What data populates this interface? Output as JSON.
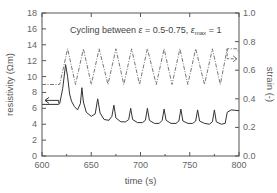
{
  "chart_data": {
    "type": "line",
    "title": "",
    "annotation": {
      "prefix": "Cycling between ",
      "epsilon": "ε",
      "range": " = 0.5-0.75, ",
      "epsilon_max": "ε",
      "max_sub": "max",
      "max_value": " = 1"
    },
    "xlabel": "time (s)",
    "ylabel_left": "resistivity (Ωm)",
    "ylabel_right": "strain (-)",
    "xlim": [
      600,
      800
    ],
    "ylim_left": [
      0,
      18
    ],
    "ylim_right": [
      0.0,
      1.0
    ],
    "x_ticks": [
      "600",
      "650",
      "700",
      "750",
      "800"
    ],
    "y_ticks_left": [
      "0",
      "2",
      "4",
      "6",
      "8",
      "10",
      "12",
      "14",
      "16",
      "18"
    ],
    "y_ticks_right": [
      "0.0",
      "0.2",
      "0.4",
      "0.6",
      "0.8",
      "1.0"
    ],
    "grid": false,
    "legend": "none (arrows indicate axis for each series)",
    "series": [
      {
        "name": "resistivity",
        "axis": "left",
        "style": "solid",
        "color": "#333333",
        "x": [
          600,
          617,
          618,
          621,
          624,
          626,
          628,
          630,
          633,
          636,
          639,
          640.5,
          642,
          645,
          650,
          654,
          656.5,
          659,
          663,
          668,
          671,
          673,
          675,
          680,
          685,
          688,
          690,
          692,
          697,
          702,
          705,
          707,
          709,
          714,
          719,
          722,
          724,
          726,
          731,
          736,
          739,
          741,
          743,
          748,
          753,
          756,
          758,
          760,
          765,
          770,
          773,
          775,
          777,
          782,
          786,
          788,
          792,
          800
        ],
        "y": [
          6.5,
          6.5,
          6.6,
          8.5,
          11.5,
          10.0,
          7.8,
          6.9,
          6.2,
          5.8,
          6.6,
          8.6,
          6.8,
          5.5,
          5.0,
          5.3,
          7.2,
          5.4,
          4.6,
          4.5,
          5.0,
          6.4,
          4.8,
          4.3,
          4.3,
          4.6,
          6.0,
          4.6,
          4.2,
          4.2,
          4.5,
          6.0,
          4.5,
          4.1,
          4.1,
          4.5,
          5.9,
          4.5,
          4.1,
          4.1,
          4.4,
          5.9,
          4.4,
          4.1,
          4.1,
          4.4,
          5.8,
          4.4,
          4.1,
          4.0,
          4.3,
          5.8,
          4.3,
          4.0,
          4.1,
          5.5,
          5.8,
          5.7
        ]
      },
      {
        "name": "strain",
        "axis": "right",
        "style": "dash-dot",
        "color": "#777777",
        "x": [
          600,
          618,
          626,
          634,
          642,
          650,
          658,
          667,
          675,
          683,
          691,
          699,
          707,
          716,
          724,
          732,
          740,
          748,
          756,
          765,
          773,
          781,
          788,
          798,
          800
        ],
        "y": [
          0.5,
          0.5,
          0.75,
          0.5,
          0.75,
          0.5,
          0.75,
          0.5,
          0.75,
          0.5,
          0.75,
          0.5,
          0.75,
          0.5,
          0.75,
          0.5,
          0.75,
          0.5,
          0.75,
          0.5,
          0.75,
          0.5,
          0.75,
          0.75,
          0.72
        ]
      }
    ],
    "arrows": [
      {
        "series": "resistivity",
        "direction": "left",
        "at_x": 605,
        "at_y": 7.0
      },
      {
        "series": "strain",
        "direction": "right",
        "at_x": 795,
        "at_y": 0.68
      }
    ]
  }
}
